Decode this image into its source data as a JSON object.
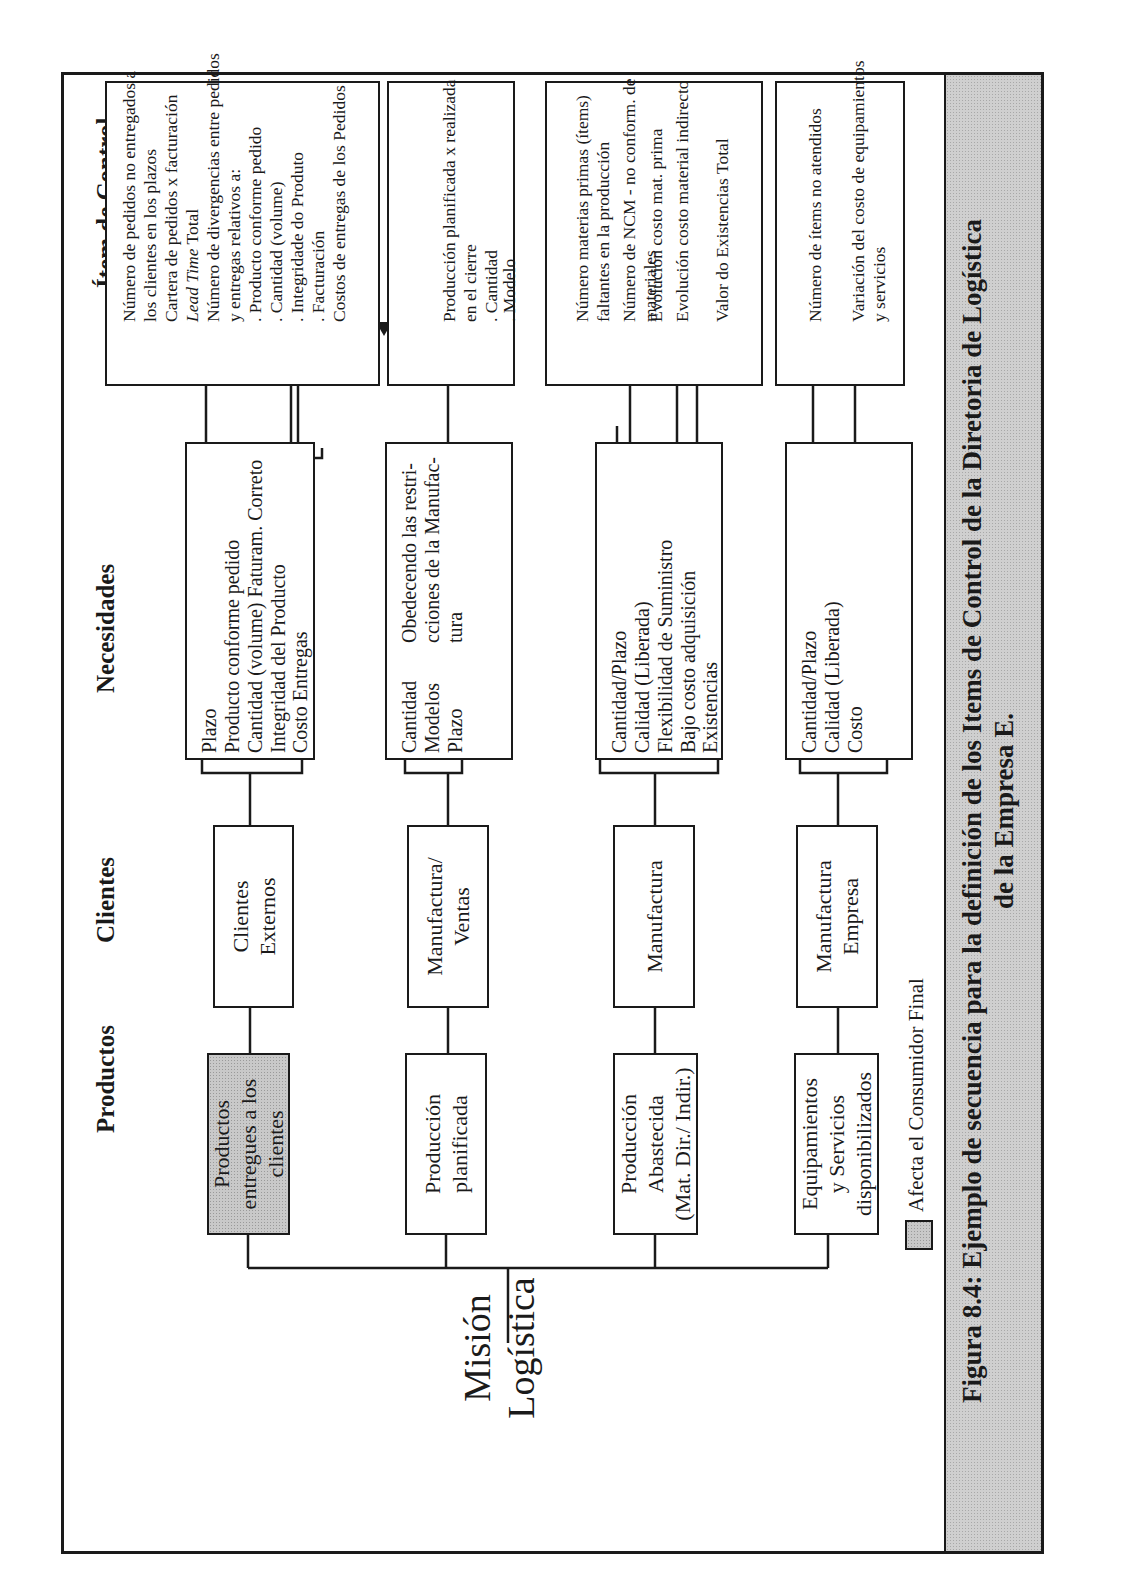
{
  "headers": {
    "productos": "Productos",
    "clientes": "Clientes",
    "necesidades": "Necesidades",
    "item_control": "Ítem de Control"
  },
  "mission": {
    "line1": "Misión",
    "line2": "Logística"
  },
  "rows": [
    {
      "product": {
        "lines": [
          "Productos",
          "entregues a los",
          "clientes"
        ],
        "affects_final_consumer": true
      },
      "client": {
        "lines": [
          "Clientes",
          "Externos"
        ]
      },
      "needs": [
        "Plazo",
        "Producto conforme pedido",
        "Cantidad (volume) Faturam. Correto",
        "Integridad del Producto",
        "Costo Entregas"
      ],
      "items": [
        {
          "text": "Número de pedidos no entregados a",
          "arrow": true
        },
        {
          "text": "los clientes en los plazos",
          "arrow": false
        },
        {
          "text": "Cartera de pedidos x facturación",
          "arrow": true
        },
        {
          "text_italic": "Lead Time",
          "text": " Total",
          "arrow": true
        },
        {
          "text": "Número de divergencias entre pedidos",
          "arrow": true
        },
        {
          "text": "y entregas relativos a:",
          "arrow": false
        },
        {
          "text": " . Producto conforme pedido",
          "arrow": false
        },
        {
          "text": " . Cantidad (volume)",
          "arrow": false
        },
        {
          "text": " . Integridade do Produto",
          "arrow": false
        },
        {
          "text": " . Facturación",
          "arrow": false
        },
        {
          "text": "Costos de entregas de los Pedidos",
          "arrow": true
        }
      ]
    },
    {
      "product": {
        "lines": [
          "Producción",
          "planificada"
        ],
        "affects_final_consumer": false
      },
      "client": {
        "lines": [
          "Manufactura/",
          "Ventas"
        ]
      },
      "needs": [
        "Cantidad",
        "Modelos",
        "Plazo"
      ],
      "needs_note": [
        "Obedecendo las restri-",
        "cciones de la Manufac-",
        "tura"
      ],
      "items": [
        {
          "text": "Producción planificada x realizada",
          "arrow": true
        },
        {
          "text": "en el cierre",
          "arrow": false
        },
        {
          "text": " . Cantidad",
          "arrow": false
        },
        {
          "text": " . Modelo",
          "arrow": false
        }
      ]
    },
    {
      "product": {
        "lines": [
          "Producción",
          "Abastecida",
          "(Mat. Dir./ Indir.)"
        ],
        "affects_final_consumer": false
      },
      "client": {
        "lines": [
          "Manufactura"
        ]
      },
      "needs": [
        "Cantidad/Plazo",
        "Calidad (Liberada)",
        "Flexibilidad de Suministro",
        "Bajo costo adquisición",
        "Existencias"
      ],
      "items": [
        {
          "text": "Número materias primas (ítems)",
          "arrow": true
        },
        {
          "text": "faltantes en la producción",
          "arrow": false
        },
        {
          "text": "Número de NCM - no conform. de",
          "arrow": true
        },
        {
          "text": "materiales",
          "arrow": false
        },
        {
          "text": "Evolución costo mat. prima",
          "arrow": true
        },
        {
          "text": "Evolución costo material indirecto",
          "arrow": true
        },
        {
          "text": "Valor do Existencias Total",
          "arrow": true
        }
      ]
    },
    {
      "product": {
        "lines": [
          "Equipamientos",
          "y Servicios",
          "disponibilizados"
        ],
        "affects_final_consumer": false
      },
      "client": {
        "lines": [
          "Manufactura",
          "Empresa"
        ]
      },
      "needs": [
        "Cantidad/Plazo",
        "Calidad (Liberada)",
        "Costo"
      ],
      "items": [
        {
          "text": "Número de ítems no atendidos",
          "arrow": true
        },
        {
          "text": "Variación del costo de equipamientos",
          "arrow": true
        },
        {
          "text": "y servicios",
          "arrow": false
        }
      ]
    }
  ],
  "legend": {
    "label": "Afecta el Consumidor Final",
    "swatch_color": "#c9c9c9"
  },
  "caption": {
    "line1": "Figura 8.4: Ejemplo de secuencia para la definición de los Items de Control de la Diretoria de Logística",
    "line2": "de la Empresa E."
  },
  "colors": {
    "ink": "#1a1a1a",
    "shade": "#c9c9c9",
    "background": "#ffffff"
  }
}
